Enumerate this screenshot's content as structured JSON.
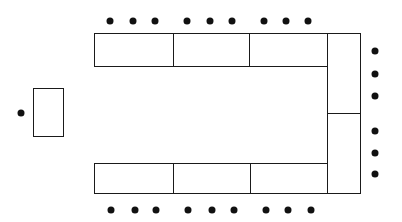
{
  "diagram": {
    "title": "",
    "colors": {
      "line": "#1a1a1a",
      "seat": "#111111",
      "background": "#ffffff"
    },
    "tables": [
      {
        "id": "top-1",
        "x": 94,
        "y": 33,
        "w": 80,
        "h": 34
      },
      {
        "id": "top-2",
        "x": 173,
        "y": 33,
        "w": 77,
        "h": 34
      },
      {
        "id": "top-3",
        "x": 249,
        "y": 33,
        "w": 79,
        "h": 34
      },
      {
        "id": "right-1",
        "x": 327,
        "y": 33,
        "w": 34,
        "h": 81
      },
      {
        "id": "right-2",
        "x": 327,
        "y": 113,
        "w": 34,
        "h": 81
      },
      {
        "id": "bottom-1",
        "x": 94,
        "y": 163,
        "w": 80,
        "h": 31
      },
      {
        "id": "bottom-2",
        "x": 173,
        "y": 163,
        "w": 78,
        "h": 31
      },
      {
        "id": "bottom-3",
        "x": 250,
        "y": 163,
        "w": 78,
        "h": 31
      },
      {
        "id": "head",
        "x": 33,
        "y": 88,
        "w": 31,
        "h": 49
      }
    ],
    "seats": {
      "top": [
        [
          110,
          21
        ],
        [
          133,
          21
        ],
        [
          155,
          21
        ],
        [
          187,
          21
        ],
        [
          210,
          21
        ],
        [
          232,
          21
        ],
        [
          264,
          21
        ],
        [
          286,
          21
        ],
        [
          308,
          21
        ]
      ],
      "bottom": [
        [
          111,
          210
        ],
        [
          135,
          210
        ],
        [
          156,
          210
        ],
        [
          188,
          210
        ],
        [
          212,
          210
        ],
        [
          234,
          210
        ],
        [
          266,
          210
        ],
        [
          288,
          210
        ],
        [
          311,
          210
        ]
      ],
      "right": [
        [
          375,
          51
        ],
        [
          375,
          74
        ],
        [
          375,
          96
        ],
        [
          375,
          131
        ],
        [
          375,
          153
        ],
        [
          375,
          174
        ]
      ],
      "head": [
        [
          21,
          113
        ]
      ]
    },
    "counts": {
      "tables": 9,
      "seats": 25
    }
  }
}
